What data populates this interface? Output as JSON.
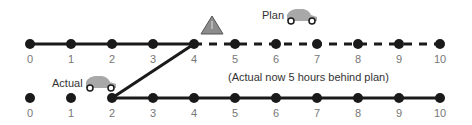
{
  "plan": {
    "label": "Plan",
    "ticks": [
      "0",
      "1",
      "2",
      "3",
      "4",
      "5",
      "6",
      "7",
      "8",
      "9",
      "10"
    ],
    "solid_until": 4,
    "dashed_from": 4
  },
  "actual": {
    "label": "Actual",
    "ticks": [
      "0",
      "1",
      "2",
      "3",
      "4",
      "5",
      "6",
      "7",
      "8",
      "9",
      "10"
    ],
    "line_from": 2
  },
  "note": "(Actual now 5 hours behind plan)",
  "warning_icon": "warning-triangle-icon",
  "car_icon": "car-icon",
  "colors": {
    "line": "#1a1a1a",
    "car": "#a8a8a8",
    "warning": "#8c8c8c",
    "text": "#777777"
  }
}
